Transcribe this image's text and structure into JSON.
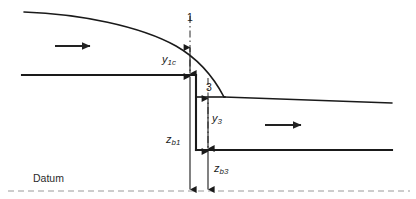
{
  "figure": {
    "type": "engineering-diagram",
    "background_color": "#ffffff",
    "line_color": "#1a1a1a",
    "datum_line_color": "#8f8f8f",
    "dimension_line_color": "#2b2b2b",
    "labels": {
      "datum": "Datum",
      "section_1": "1",
      "section_3": "3",
      "y_1c": {
        "base": "y",
        "sub": "1c"
      },
      "y_3": {
        "base": "y",
        "sub": "3"
      },
      "z_b1": {
        "base": "z",
        "sub": "b1"
      },
      "z_b3": {
        "base": "z",
        "sub": "b3"
      }
    },
    "flow_arrows": [
      {
        "name": "upstream-flow-arrow",
        "x1": 55,
        "y1": 46,
        "x2": 90,
        "y2": 46
      },
      {
        "name": "downstream-flow-arrow",
        "x1": 265,
        "y1": 125,
        "x2": 301,
        "y2": 125
      }
    ],
    "geometry": {
      "upstream_water_surface": "M 24,12 C 80,14 140,26 176,46 C 197,58 213,76 224,97",
      "upstream_bed_y": 75,
      "upstream_bed_x_start": 22,
      "upstream_bed_x_end": 196,
      "drop_wall_x": 196,
      "drop_wall_y_top": 75,
      "drop_wall_y_bottom": 150,
      "downstream_bed_y": 150,
      "downstream_bed_x_start": 196,
      "downstream_bed_x_end": 392,
      "downstream_surface_x_start": 224,
      "downstream_surface_y_start": 97,
      "downstream_surface_x_end": 392,
      "downstream_surface_y_end": 103,
      "step_top_y": 97,
      "step_top_x_start": 196,
      "step_top_x_end": 224,
      "datum_y": 191,
      "datum_x_start": 8,
      "datum_x_end": 410
    },
    "dimensions": [
      {
        "name": "y1c",
        "axis_x": 190,
        "y_top": 46,
        "y_bottom": 75
      },
      {
        "name": "zb1",
        "axis_x": 190,
        "y_top": 75,
        "y_bottom": 191
      },
      {
        "name": "y3",
        "axis_x": 208,
        "y_top": 97,
        "y_bottom": 150
      },
      {
        "name": "zb3",
        "axis_x": 208,
        "y_top": 150,
        "y_bottom": 191
      }
    ],
    "section_lines": [
      {
        "name": "section-1-centerline",
        "x": 190,
        "y_top": 26,
        "y_bottom": 75
      },
      {
        "name": "section-3-centerline",
        "x": 208,
        "y_top": 82,
        "y_bottom": 150
      }
    ]
  }
}
